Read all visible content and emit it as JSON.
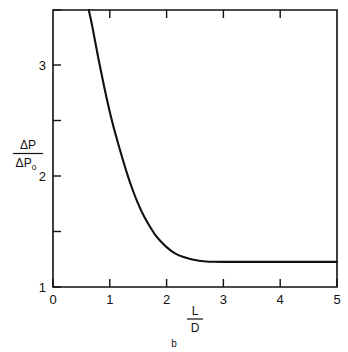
{
  "figure": {
    "caption": "b",
    "background_color": "#ffffff",
    "line_color": "#111111"
  },
  "chart_data": {
    "type": "line",
    "title": "",
    "subtitle": "",
    "caption": "b",
    "xlabel": "L/D",
    "xlabel_numerator": "L",
    "xlabel_denominator": "D",
    "ylabel": "ΔP/ΔPo",
    "ylabel_numerator": "ΔP",
    "ylabel_denominator": "ΔPo",
    "ylabel_denominator_base": "ΔP",
    "ylabel_denominator_sub": "o",
    "xlim": [
      0,
      5
    ],
    "ylim": [
      1,
      3.5
    ],
    "grid": false,
    "legend": "none",
    "x_major_ticks": [
      0,
      1,
      2,
      3,
      4,
      5
    ],
    "x_tick_labels": [
      "0",
      "1",
      "2",
      "3",
      "4",
      "5"
    ],
    "y_major_ticks": [
      1,
      2,
      3
    ],
    "y_tick_labels": [
      "1",
      "2",
      "3"
    ],
    "y_minor_ticks": [
      1.5,
      2.5,
      3.5
    ],
    "series": [
      {
        "name": "pressure-drop-ratio",
        "x": [
          0.63,
          0.7,
          0.8,
          0.9,
          1.0,
          1.1,
          1.2,
          1.3,
          1.4,
          1.5,
          1.6,
          1.7,
          1.8,
          1.9,
          2.0,
          2.1,
          2.2,
          2.3,
          2.4,
          2.5,
          2.6,
          2.7,
          2.8,
          3.0,
          3.5,
          4.0,
          4.5,
          5.0
        ],
        "y": [
          3.5,
          3.33,
          3.06,
          2.81,
          2.58,
          2.38,
          2.2,
          2.03,
          1.88,
          1.75,
          1.64,
          1.55,
          1.47,
          1.41,
          1.36,
          1.32,
          1.29,
          1.27,
          1.255,
          1.243,
          1.235,
          1.23,
          1.228,
          1.227,
          1.227,
          1.227,
          1.227,
          1.227
        ]
      }
    ],
    "asymptote_value": 1.23,
    "curve_enters_top_at_x": 0.63
  }
}
